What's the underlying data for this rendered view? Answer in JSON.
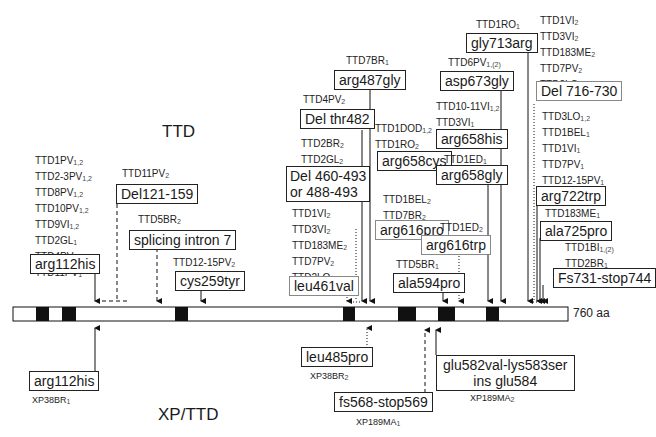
{
  "titles": {
    "top": "TTD",
    "bottom": "XP/TTD"
  },
  "protein": {
    "length_label": "760 aa",
    "length": 760
  },
  "ttd": {
    "arg112his": {
      "patients": [
        "TTD1PV1,2",
        "TTD2-3PV1,2",
        "TTD8PV1,2",
        "TTD10PV1,2",
        "TTD9VI1,2",
        "TTD2GL1",
        "TTD4PV1",
        "TTD11PV1"
      ],
      "mutation": "arg112his"
    },
    "del121": {
      "patients": [
        "TTD11PV2"
      ],
      "mutation": "Del121-159"
    },
    "splicing": {
      "patients": [
        "TTD5BR2"
      ],
      "mutation": "splicing intron 7"
    },
    "cys259tyr": {
      "patients": [
        "TTD12-15PV2"
      ],
      "mutation": "cys259tyr"
    },
    "delthr482": {
      "patients": [
        "TTD4PV2"
      ],
      "mutation": "Del thr482"
    },
    "del460": {
      "patients": [
        "TTD2BR2",
        "TTD2GL2"
      ],
      "mutation_line1": "Del 460-493",
      "mutation_line2": "or 488-493"
    },
    "leu461val": {
      "patients": [
        "TTD1VI2",
        "TTD3VI2",
        "TTD183ME2",
        "TTD7PV2",
        "TTD2LO2"
      ],
      "mutation": "leu461val"
    },
    "arg487gly": {
      "patients": [
        "TTD7BR1"
      ],
      "mutation": "arg487gly"
    },
    "arg658cys": {
      "patients": [
        "TTD1DOD1,2",
        "TTD1RO2"
      ],
      "mutation": "arg658cys"
    },
    "arg616pro": {
      "patients": [
        "TTD1BEL2",
        "TTD7BR2"
      ],
      "mutation": "arg616pro"
    },
    "arg616trp": {
      "patients": [
        "TTD1ED2"
      ],
      "mutation": "arg616trp"
    },
    "ala594pro": {
      "patients": [
        "TTD5BR1"
      ],
      "mutation": "ala594pro"
    },
    "gly713arg": {
      "patients": [
        "TTD1RO1"
      ],
      "mutation": "gly713arg"
    },
    "asp673gly": {
      "patients": [
        "TTD6PV1,(2)"
      ],
      "mutation": "asp673gly"
    },
    "arg658his": {
      "patients": [
        "TTD10-11VI1,2",
        "TTD3VI1"
      ],
      "mutation": "arg658his"
    },
    "arg658gly": {
      "patients": [
        "TTD1ED1"
      ],
      "mutation": "arg658gly"
    },
    "del716": {
      "patients": [
        "TTD1VI2",
        "TTD3VI2",
        "TTD183ME2",
        "TTD7PV2",
        "TTD2LO2"
      ],
      "mutation": "Del 716-730"
    },
    "arg722trp": {
      "patients": [
        "TTD3LO1,2",
        "TTD1BEL1",
        "TTD1VI1",
        "TTD7PV1",
        "TTD12-15PV1",
        "TTD2LO1"
      ],
      "mutation": "arg722trp"
    },
    "ala725pro": {
      "patients": [
        "TTD183ME1"
      ],
      "mutation": "ala725pro"
    },
    "fs731": {
      "patients": [
        "TTD1BI1,(2)",
        "TTD2BR1"
      ],
      "mutation": "Fs731-stop744"
    }
  },
  "xp": {
    "arg112his": {
      "mutation": "arg112his",
      "patient": "XP38BR1"
    },
    "leu485pro": {
      "mutation": "leu485pro",
      "patient": "XP38BR2"
    },
    "fs568": {
      "mutation": "fs568-stop569",
      "patient": "XP189MA1"
    },
    "glu582": {
      "mutation_line1": "glu582val-lys583ser",
      "mutation_line2": "ins glu584",
      "patient": "XP189MA2"
    }
  }
}
